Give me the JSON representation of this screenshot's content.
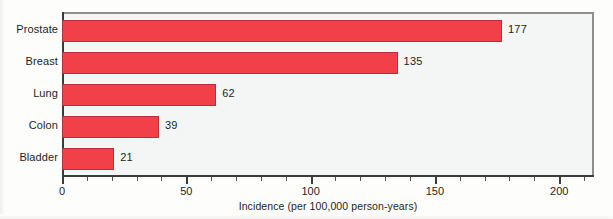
{
  "chart_data": {
    "type": "bar",
    "orientation": "horizontal",
    "title": "",
    "subtitle": "",
    "xlabel": "Incidence (per 100,000 person-years)",
    "ylabel": "",
    "categories": [
      "Prostate",
      "Breast",
      "Lung",
      "Colon",
      "Bladder"
    ],
    "values": [
      177,
      135,
      62,
      39,
      21
    ],
    "value_labels": [
      "177",
      "135",
      "62",
      "39",
      "21"
    ],
    "xlim": [
      0,
      214
    ],
    "xticks": [
      0,
      50,
      100,
      150,
      200
    ],
    "xtick_labels": [
      "0",
      "50",
      "100",
      "150",
      "200"
    ],
    "minor_tick_step": 10,
    "grid": false,
    "legend": null,
    "bar_color": "#f24049",
    "bar_edge_color": "#b5303a",
    "plot_background": "#f4f6f5",
    "frame_color": "#8e8e8e",
    "axis_color": "#3b3b3b"
  }
}
